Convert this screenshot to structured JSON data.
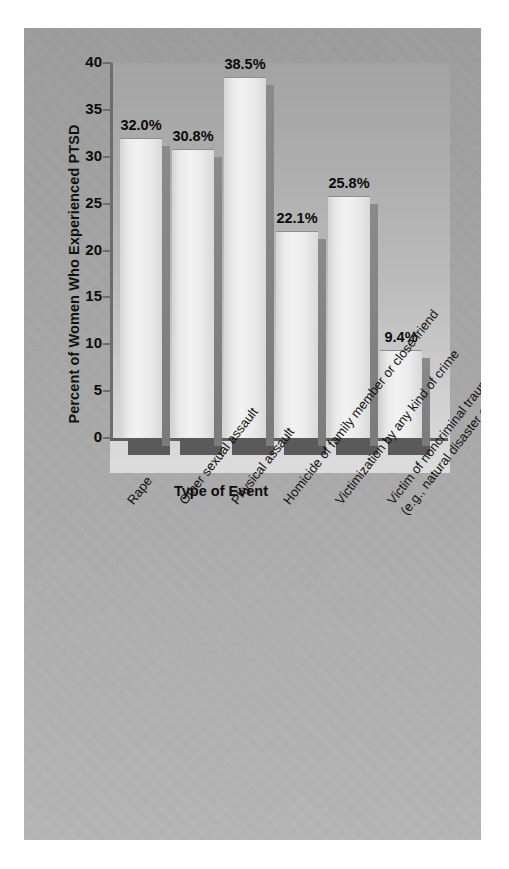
{
  "chart_data": {
    "type": "bar",
    "title": "",
    "xlabel": "Type of Event",
    "ylabel": "Percent of Women Who Experienced PTSD",
    "ylim": [
      0,
      40
    ],
    "yticks": [
      "40",
      "35",
      "30",
      "25",
      "20",
      "15",
      "10",
      "5",
      "0"
    ],
    "ytick_values": [
      40,
      35,
      30,
      25,
      20,
      15,
      10,
      5,
      0
    ],
    "grid": false,
    "legend": "none",
    "categories": [
      "Rape",
      "Other sexual assault",
      "Physical assault",
      "Homicide of family member or close friend",
      "Victimization by any kind of crime",
      "Victim of noncriminal trauma (e.g., natural disaster or accident)"
    ],
    "category_lines": [
      [
        "Rape"
      ],
      [
        "Other sexual assault"
      ],
      [
        "Physical assault"
      ],
      [
        "Homicide of family member or close friend"
      ],
      [
        "Victimization by any kind of crime"
      ],
      [
        "Victim of noncriminal trauma",
        "(e.g., natural disaster or accident)"
      ]
    ],
    "values": [
      32.0,
      30.8,
      38.5,
      22.1,
      25.8,
      9.4
    ],
    "value_labels": [
      "32.0%",
      "30.8%",
      "38.5%",
      "22.1%",
      "25.8%",
      "9.4%"
    ]
  },
  "colors": {
    "panel_background": "#a8a8a8",
    "plot_background": "#b9b9b9",
    "bar_face": "#eeeeee",
    "bar_side": "#828282",
    "bar_shadow": "#5a5a5a",
    "axis": "#6d6d6d",
    "text": "#111111"
  }
}
